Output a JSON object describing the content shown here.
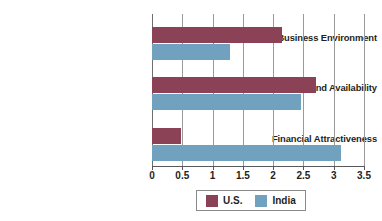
{
  "chart_data": {
    "type": "bar",
    "orientation": "horizontal",
    "title": "",
    "subtitle": "",
    "xlabel": "",
    "ylabel": "",
    "categories": [
      "Business Environment",
      "People Skills and Availability",
      "Financial Attractiveness"
    ],
    "series": [
      {
        "name": "U.S.",
        "color": "#8b4257",
        "values": [
          2.15,
          2.7,
          0.48
        ]
      },
      {
        "name": "India",
        "color": "#70a2bf",
        "values": [
          1.28,
          2.46,
          3.12
        ]
      }
    ],
    "xlim": [
      0,
      3.5
    ],
    "xticks": [
      0,
      0.5,
      1,
      1.5,
      2,
      2.5,
      3,
      3.5
    ],
    "xtick_labels": [
      "0",
      "0.5",
      "1",
      "1.5",
      "2",
      "2.5",
      "3",
      "3.5"
    ],
    "grid": true,
    "grid_axis": "x",
    "legend_position": "bottom",
    "legend_entries": [
      "U.S.",
      "India"
    ]
  },
  "legend": {
    "items": [
      {
        "label": "U.S.",
        "color": "#8b4257"
      },
      {
        "label": "India",
        "color": "#70a2bf"
      }
    ]
  },
  "colors": {
    "us": "#8b4257",
    "india": "#70a2bf",
    "grid": "#9a9a9a",
    "axis": "#58585a",
    "text": "#231f20",
    "background": "#ffffff"
  }
}
